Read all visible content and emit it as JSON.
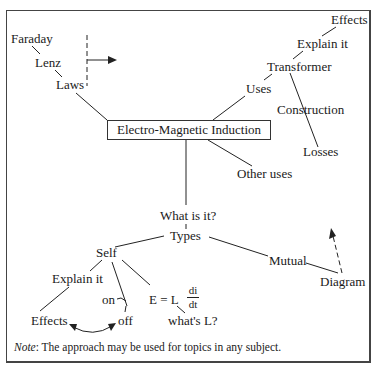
{
  "diagram": {
    "type": "mind-map",
    "center": "Electro-Magnetic Induction",
    "nodes": {
      "faraday": "Faraday",
      "lenz": "Lenz",
      "laws": "Laws",
      "effects_top": "Effects",
      "explain_top": "Explain it",
      "transformer": "Transformer",
      "uses": "Uses",
      "construction": "Construction",
      "losses": "Losses",
      "other_uses": "Other uses",
      "what_is_it": "What is it?",
      "types": "Types",
      "self": "Self",
      "mutual": "Mutual",
      "diagram": "Diagram",
      "explain_self": "Explain it",
      "effects_self": "Effects",
      "on": "on",
      "off": "off",
      "formula_lhs": "E = L",
      "formula_num": "di",
      "formula_den": "dt",
      "whats_l": "what's L?"
    },
    "note_label": "Note",
    "note_text": ": The approach may be used for topics in any subject."
  }
}
